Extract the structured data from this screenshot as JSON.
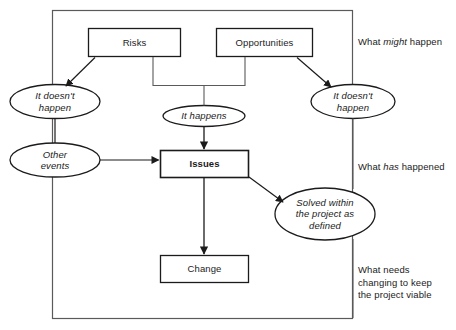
{
  "diagram": {
    "frame": {
      "stroke": "#555555"
    },
    "stroke_color": "#1b1b1b",
    "text_color": "#1b1b1b",
    "background": "#ffffff",
    "nodes": {
      "risks": {
        "label": "Risks",
        "shape": "rectangle"
      },
      "opportunities": {
        "label": "Opportunities",
        "shape": "rectangle"
      },
      "risk_not_happen": {
        "label": "It doesn't\nhappen",
        "shape": "ellipse"
      },
      "opportunity_not_happen": {
        "label": "It doesn't\nhappen",
        "shape": "ellipse"
      },
      "it_happens": {
        "label": "It happens",
        "shape": "ellipse"
      },
      "other_events": {
        "label": "Other\nevents",
        "shape": "ellipse"
      },
      "issues": {
        "label": "Issues",
        "shape": "rectangle"
      },
      "solved": {
        "label": "Solved within\nthe project as\ndefined",
        "shape": "ellipse"
      },
      "change": {
        "label": "Change",
        "shape": "rectangle"
      }
    },
    "side_notes": {
      "might_happen": {
        "before": "What ",
        "emphasis": "might",
        "after": " happen"
      },
      "has_happened": {
        "before": "What ",
        "emphasis": "has",
        "after": " happened"
      },
      "needs_changing": {
        "text": "What needs\nchanging to keep\nthe project viable"
      }
    },
    "edges": [
      {
        "from": "risks",
        "to": "risk_not_happen",
        "arrow": true
      },
      {
        "from": "risks",
        "to": "it_happens",
        "arrow": false
      },
      {
        "from": "opportunities",
        "to": "opportunity_not_happen",
        "arrow": true
      },
      {
        "from": "opportunities",
        "to": "it_happens",
        "arrow": false
      },
      {
        "from": "it_happens",
        "to": "issues",
        "arrow": true
      },
      {
        "from": "risk_not_happen",
        "to": "other_events",
        "arrow": false
      },
      {
        "from": "other_events",
        "to": "issues",
        "arrow": true
      },
      {
        "from": "issues",
        "to": "solved",
        "arrow": true
      },
      {
        "from": "issues",
        "to": "change",
        "arrow": true
      },
      {
        "from": "opportunity_not_happen",
        "to": "solved",
        "arrow": false
      }
    ]
  }
}
